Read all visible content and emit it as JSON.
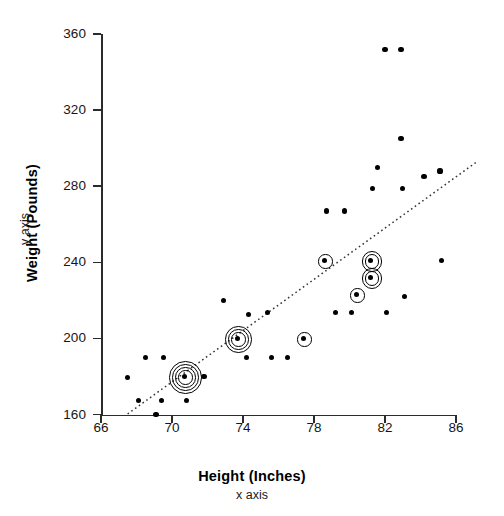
{
  "chart_data": {
    "type": "scatter",
    "title": "",
    "xlabel": "Height (Inches)",
    "xlabel_sub": "x axis",
    "ylabel": "Weight (Pounds)",
    "ylabel_sub": "y axis",
    "xlim": [
      66,
      86
    ],
    "ylim": [
      160,
      360
    ],
    "xticks": [
      66,
      70,
      74,
      78,
      82,
      86
    ],
    "yticks": [
      160,
      200,
      240,
      280,
      320,
      360
    ],
    "grid": false,
    "legend": null,
    "marker_color": "#000000",
    "line_color": "#333333",
    "line_style": "dotted",
    "trendline": {
      "type": "linear",
      "x_start": 67.5,
      "y_start": 160.3,
      "x_end": 87.2,
      "y_end": 293.0
    },
    "points": [
      {
        "x": 67.5,
        "y": 179.5,
        "n": 1
      },
      {
        "x": 68.1,
        "y": 167.5,
        "n": 1
      },
      {
        "x": 68.5,
        "y": 190.0,
        "n": 1
      },
      {
        "x": 69.1,
        "y": 160.0,
        "n": 1
      },
      {
        "x": 69.4,
        "y": 167.5,
        "n": 1
      },
      {
        "x": 69.5,
        "y": 190.0,
        "n": 1
      },
      {
        "x": 70.7,
        "y": 180.0,
        "n": 5
      },
      {
        "x": 70.8,
        "y": 167.5,
        "n": 1
      },
      {
        "x": 71.8,
        "y": 180.0,
        "n": 1
      },
      {
        "x": 72.9,
        "y": 220.0,
        "n": 1
      },
      {
        "x": 73.7,
        "y": 200.0,
        "n": 4
      },
      {
        "x": 74.2,
        "y": 190.0,
        "n": 1
      },
      {
        "x": 74.3,
        "y": 212.5,
        "n": 1
      },
      {
        "x": 75.4,
        "y": 213.5,
        "n": 1
      },
      {
        "x": 75.6,
        "y": 190.0,
        "n": 1
      },
      {
        "x": 76.5,
        "y": 190.0,
        "n": 1
      },
      {
        "x": 77.4,
        "y": 200.0,
        "n": 2
      },
      {
        "x": 78.6,
        "y": 241.0,
        "n": 2
      },
      {
        "x": 78.7,
        "y": 267.0,
        "n": 1
      },
      {
        "x": 79.2,
        "y": 213.5,
        "n": 1
      },
      {
        "x": 79.7,
        "y": 267.0,
        "n": 1
      },
      {
        "x": 80.1,
        "y": 213.5,
        "n": 1
      },
      {
        "x": 80.4,
        "y": 223.0,
        "n": 2
      },
      {
        "x": 81.2,
        "y": 241.0,
        "n": 3
      },
      {
        "x": 81.2,
        "y": 232.0,
        "n": 3
      },
      {
        "x": 81.3,
        "y": 279.0,
        "n": 1
      },
      {
        "x": 81.6,
        "y": 290.0,
        "n": 1
      },
      {
        "x": 82.0,
        "y": 352.0,
        "n": 1
      },
      {
        "x": 82.1,
        "y": 213.5,
        "n": 1
      },
      {
        "x": 82.9,
        "y": 352.0,
        "n": 1
      },
      {
        "x": 82.9,
        "y": 305.0,
        "n": 1
      },
      {
        "x": 83.0,
        "y": 279.0,
        "n": 1
      },
      {
        "x": 83.1,
        "y": 222.0,
        "n": 1
      },
      {
        "x": 84.2,
        "y": 285.0,
        "n": 1
      },
      {
        "x": 85.1,
        "y": 288.0,
        "n": 1
      },
      {
        "x": 85.2,
        "y": 241.0,
        "n": 1
      }
    ]
  }
}
